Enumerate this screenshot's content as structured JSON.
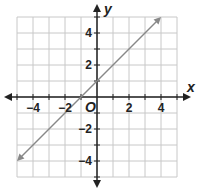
{
  "chart_data": {
    "type": "line",
    "title": "",
    "xlabel": "x",
    "ylabel": "y",
    "origin_label": "O",
    "xlim": [
      -5,
      5
    ],
    "ylim": [
      -5,
      5
    ],
    "grid": true,
    "x_ticks": [
      -4,
      -2,
      2,
      4
    ],
    "y_ticks": [
      4,
      2,
      -2,
      -4
    ],
    "x_tick_labels": [
      "−4",
      "−2",
      "2",
      "4"
    ],
    "y_tick_labels": [
      "4",
      "2",
      "−2",
      "−4"
    ],
    "series": [
      {
        "name": "line",
        "equation": "y = x + 1",
        "x": [
          -5,
          4
        ],
        "y": [
          -4,
          5
        ],
        "arrows": "both"
      }
    ],
    "colors": {
      "line": "#888888",
      "grid": "#c8c8c8",
      "axis": "#222222"
    }
  }
}
